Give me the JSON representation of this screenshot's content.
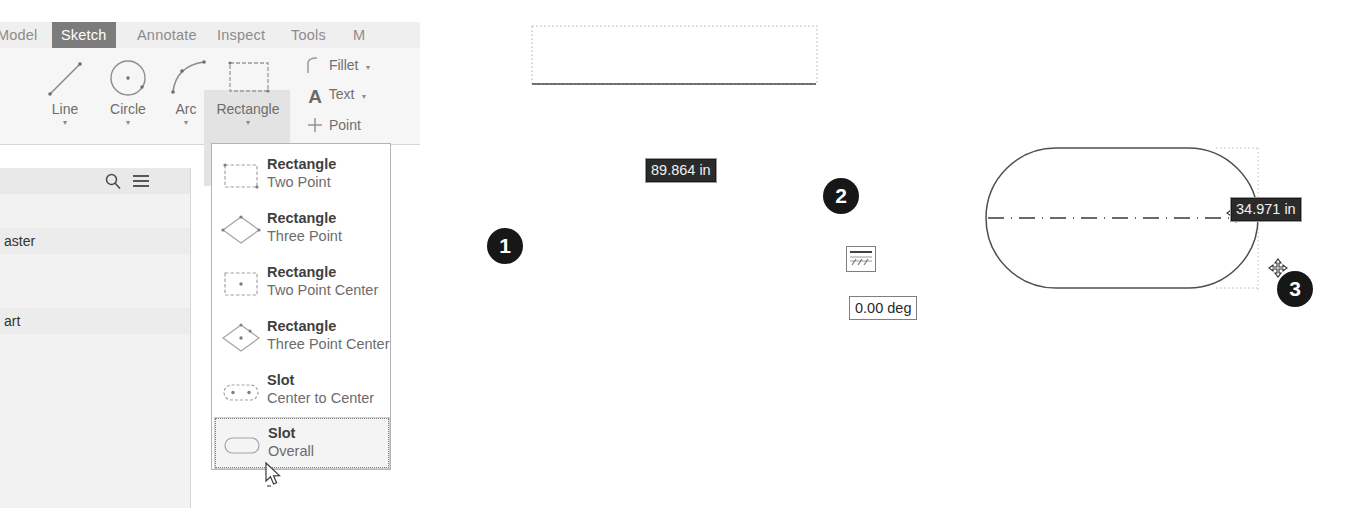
{
  "app": {
    "name": "cad-sketch-environment"
  },
  "ribbon": {
    "tabs": [
      {
        "label": "Model",
        "active": false
      },
      {
        "label": "Sketch",
        "active": true
      },
      {
        "label": "Annotate",
        "active": false
      },
      {
        "label": "Inspect",
        "active": false
      },
      {
        "label": "Tools",
        "active": false
      },
      {
        "label": "M",
        "active": false
      }
    ],
    "commands": [
      {
        "label": "Line",
        "icon": "line-icon",
        "has_dropdown": true
      },
      {
        "label": "Circle",
        "icon": "circle-icon",
        "has_dropdown": true
      },
      {
        "label": "Arc",
        "icon": "arc-icon",
        "has_dropdown": true
      },
      {
        "label": "Rectangle",
        "icon": "rectangle-icon",
        "has_dropdown": true
      }
    ],
    "small_commands": [
      {
        "label": "Fillet",
        "icon": "fillet-icon",
        "arrow": "▾"
      },
      {
        "label": "Text",
        "icon": "text-a-icon",
        "arrow": "▾"
      },
      {
        "label": "Point",
        "icon": "point-icon",
        "arrow": ""
      }
    ],
    "dropdown_arrow": "▾"
  },
  "browser": {
    "search_icon": "search-icon",
    "menu_icon": "hamburger-menu-icon",
    "rows": [
      {
        "label": "aster"
      },
      {
        "label": "art"
      }
    ]
  },
  "flyout": {
    "items": [
      {
        "title": "Rectangle",
        "subtitle": "Two Point",
        "icon": "rectangle-two-point-icon",
        "selected": false
      },
      {
        "title": "Rectangle",
        "subtitle": "Three Point",
        "icon": "rectangle-three-point-icon",
        "selected": false
      },
      {
        "title": "Rectangle",
        "subtitle": "Two Point Center",
        "icon": "rectangle-two-point-center-icon",
        "selected": false
      },
      {
        "title": "Rectangle",
        "subtitle": "Three Point Center",
        "icon": "rectangle-three-point-center-icon",
        "selected": false
      },
      {
        "title": "Slot",
        "subtitle": "Center to Center",
        "icon": "slot-center-to-center-icon",
        "selected": false
      },
      {
        "title": "Slot",
        "subtitle": "Overall",
        "icon": "slot-overall-icon",
        "selected": true
      }
    ],
    "cursor_icon": "mouse-pointer-cursor"
  },
  "canvas": {
    "markers": [
      {
        "label": "1"
      },
      {
        "label": "2"
      },
      {
        "label": "3"
      }
    ],
    "dimensions": [
      {
        "value": "89.864 in",
        "name": "slot-length-dimension"
      },
      {
        "value": "34.971 in",
        "name": "slot-width-dimension"
      }
    ],
    "angle_field": {
      "value": "0.00 deg"
    },
    "mini_button_icon": "dimension-settings-icon",
    "move_cursor_icon": "move-crosshair-cursor",
    "shapes": {
      "construction_line": "sketch-line-segment",
      "slot": "slot-overall-preview",
      "centerline": "slot-centerline"
    }
  },
  "colors": {
    "tab_active_bg": "#7c7c7c",
    "ribbon_bg": "#f6f6f6",
    "panel_bg": "#f2f2f2",
    "marker_bg": "#171717",
    "dim_box_bg": "#2b2b2b",
    "geometry_stroke": "#3d3d3d"
  }
}
